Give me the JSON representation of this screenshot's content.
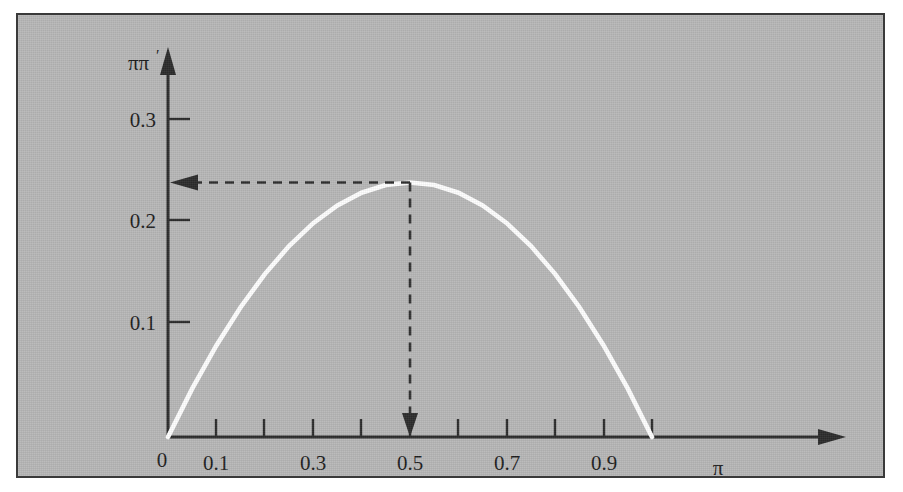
{
  "figure": {
    "background_color": "#ffffff",
    "panel_color": "#b7b7b7",
    "panel_border_color": "#3a3a3a",
    "curve_color": "#ffffff",
    "axis_color": "#2b2b2b",
    "guide_color": "#2f2f2f"
  },
  "chart_data": {
    "type": "line",
    "title": "",
    "subtitle": "",
    "xlabel": "π",
    "ylabel": "ππ′",
    "grid": false,
    "legend": null,
    "xlim": [
      0,
      1.05
    ],
    "ylim": [
      0,
      0.33
    ],
    "x_ticks": [
      0,
      0.1,
      0.2,
      0.3,
      0.4,
      0.5,
      0.6,
      0.7,
      0.8,
      0.9,
      1.0
    ],
    "x_tick_labels": [
      "0",
      "0.1",
      "",
      "0.3",
      "",
      "0.5",
      "",
      "0.7",
      "",
      "0.9",
      ""
    ],
    "y_ticks": [
      0.1,
      0.2,
      0.3
    ],
    "y_tick_labels": [
      "0.1",
      "0.2",
      "0.3"
    ],
    "series": [
      {
        "name": "ππ′ = π(1−π)",
        "x": [
          0.0,
          0.05,
          0.1,
          0.15,
          0.2,
          0.25,
          0.3,
          0.35,
          0.4,
          0.45,
          0.5,
          0.55,
          0.6,
          0.65,
          0.7,
          0.75,
          0.8,
          0.85,
          0.9,
          0.95,
          1.0
        ],
        "values": [
          0.0,
          0.0475,
          0.09,
          0.1275,
          0.16,
          0.1875,
          0.21,
          0.2275,
          0.24,
          0.2475,
          0.25,
          0.2475,
          0.24,
          0.2275,
          0.21,
          0.1875,
          0.16,
          0.1275,
          0.09,
          0.0475,
          0.0
        ]
      }
    ],
    "annotations": [
      {
        "name": "maximum-marker",
        "kind": "dashed-guide",
        "x": 0.5,
        "y": 0.25,
        "note": "dashed lines from the maximum of the curve to both axes, arrowheads pointing at π = 0.5 and ππ′ = 0.25"
      }
    ]
  },
  "labels": {
    "x_axis_title": "π",
    "y_axis_title_base": "ππ",
    "y_axis_title_prime": "′",
    "origin": "0",
    "x": {
      "t0": "0",
      "t1": "0.1",
      "t3": "0.3",
      "t5": "0.5",
      "t7": "0.7",
      "t9": "0.9"
    },
    "y": {
      "t1": "0.1",
      "t2": "0.2",
      "t3": "0.3"
    }
  }
}
